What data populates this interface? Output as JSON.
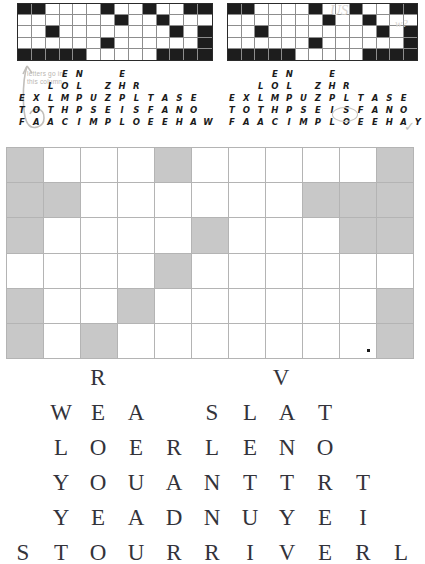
{
  "document": {
    "type": "puzzle-worksheet-scan",
    "background_color": "#ffffff"
  },
  "top_section": {
    "left_grid": {
      "name": "crossword-grid-left",
      "columns": 14,
      "rows": 5,
      "filled_color": "#1d1d1d",
      "empty_color": "#ffffff",
      "cells": [
        [
          1,
          1,
          0,
          0,
          0,
          0,
          1,
          0,
          0,
          1,
          0,
          0,
          1,
          1
        ],
        [
          0,
          0,
          0,
          0,
          0,
          0,
          0,
          1,
          0,
          0,
          1,
          0,
          0,
          0
        ],
        [
          0,
          0,
          1,
          0,
          0,
          0,
          0,
          0,
          0,
          0,
          0,
          1,
          0,
          1
        ],
        [
          0,
          0,
          0,
          0,
          0,
          0,
          1,
          0,
          0,
          0,
          0,
          0,
          0,
          1
        ],
        [
          1,
          1,
          1,
          1,
          1,
          0,
          0,
          0,
          0,
          0,
          1,
          1,
          1,
          1
        ]
      ]
    },
    "right_grid": {
      "name": "crossword-grid-right",
      "columns": 14,
      "rows": 5,
      "filled_color": "#1d1d1d",
      "empty_color": "#ffffff",
      "cells": [
        [
          1,
          1,
          0,
          0,
          0,
          0,
          1,
          0,
          0,
          1,
          0,
          0,
          1,
          1
        ],
        [
          0,
          0,
          0,
          0,
          0,
          0,
          0,
          1,
          0,
          0,
          1,
          0,
          0,
          0
        ],
        [
          0,
          0,
          1,
          0,
          0,
          0,
          0,
          0,
          0,
          0,
          0,
          1,
          0,
          1
        ],
        [
          0,
          0,
          0,
          0,
          0,
          0,
          1,
          0,
          0,
          0,
          0,
          0,
          0,
          1
        ],
        [
          1,
          1,
          1,
          1,
          1,
          0,
          0,
          0,
          0,
          0,
          1,
          1,
          1,
          1
        ]
      ]
    }
  },
  "letter_rows_left": {
    "name": "letter-rows-left",
    "rows": [
      {
        "id": "row-1",
        "letters": [
          "",
          "",
          "",
          "E",
          "N",
          "",
          "",
          "E",
          "",
          "",
          "",
          "",
          ""
        ]
      },
      {
        "id": "row-2",
        "letters": [
          "",
          "",
          "L",
          "O",
          "L",
          "",
          "Z",
          "H",
          "R",
          "",
          "",
          "",
          ""
        ]
      },
      {
        "id": "row-3",
        "letters": [
          "E",
          "X",
          "L",
          "M",
          "P",
          "U",
          "Z",
          "P",
          "L",
          "T",
          "A",
          "S",
          "E"
        ]
      },
      {
        "id": "row-4",
        "letters": [
          "T",
          "O",
          "T",
          "H",
          "P",
          "S",
          "E",
          "I",
          "S",
          "F",
          "A",
          "N",
          "O"
        ]
      },
      {
        "id": "row-5",
        "letters": [
          "F",
          "A",
          "A",
          "C",
          "I",
          "M",
          "P",
          "L",
          "O",
          "E",
          "E",
          "H",
          "A",
          "W"
        ]
      }
    ]
  },
  "letter_rows_right": {
    "name": "letter-rows-right",
    "rows": [
      {
        "id": "row-1",
        "letters": [
          "",
          "",
          "",
          "E",
          "N",
          "",
          "",
          "E",
          "",
          "",
          "",
          "",
          ""
        ]
      },
      {
        "id": "row-2",
        "letters": [
          "",
          "",
          "L",
          "O",
          "L",
          "",
          "Z",
          "H",
          "R",
          "",
          "",
          "",
          ""
        ]
      },
      {
        "id": "row-3",
        "letters": [
          "E",
          "X",
          "L",
          "M",
          "P",
          "U",
          "Z",
          "P",
          "L",
          "T",
          "A",
          "S",
          "E"
        ]
      },
      {
        "id": "row-4",
        "letters": [
          "T",
          "O",
          "T",
          "H",
          "P",
          "S",
          "E",
          "I",
          "S",
          "F",
          "A",
          "N",
          "O"
        ]
      },
      {
        "id": "row-5",
        "letters": [
          "F",
          "A",
          "A",
          "C",
          "I",
          "M",
          "P",
          "L",
          "O",
          "E",
          "E",
          "H",
          "A",
          "Y"
        ]
      }
    ]
  },
  "annotations": {
    "note_line_1": "letters go in",
    "note_line_2": "this column",
    "note_color": "#b9b6b2",
    "check_mark": "✓",
    "scribble_left": "US",
    "scribble_right": "w?"
  },
  "shaded_grid": {
    "name": "shaded-grid",
    "columns": 11,
    "rows": 6,
    "shaded_color": "#c8c8c8",
    "empty_color": "#ffffff",
    "border_color": "#b4b4b4",
    "cells": [
      [
        1,
        0,
        0,
        0,
        1,
        0,
        0,
        0,
        0,
        0,
        1
      ],
      [
        1,
        1,
        0,
        0,
        0,
        0,
        0,
        0,
        1,
        1,
        1
      ],
      [
        1,
        0,
        0,
        0,
        0,
        1,
        0,
        0,
        0,
        1,
        1
      ],
      [
        0,
        0,
        0,
        0,
        1,
        0,
        0,
        0,
        0,
        0,
        0
      ],
      [
        1,
        0,
        0,
        1,
        0,
        0,
        0,
        0,
        0,
        0,
        1
      ],
      [
        1,
        0,
        1,
        0,
        0,
        0,
        0,
        0,
        0,
        0,
        1
      ]
    ],
    "dot_marker": {
      "row": 5,
      "col": 9
    }
  },
  "pyramid": {
    "name": "letter-pyramid",
    "text_color": "#33333a",
    "rows": [
      {
        "id": "pyramid-row-1",
        "letters": [
          "R",
          "",
          "",
          "",
          "",
          "V"
        ],
        "positions": [
          98,
          0,
          0,
          0,
          0,
          281
        ]
      },
      {
        "id": "pyramid-row-2",
        "letters": [
          "W",
          "E",
          "A",
          "S",
          "L",
          "A",
          "T"
        ],
        "positions": [
          61,
          98,
          136,
          212,
          250,
          287,
          325
        ]
      },
      {
        "id": "pyramid-row-3",
        "letters": [
          "L",
          "O",
          "E",
          "R",
          "L",
          "E",
          "N",
          "O"
        ],
        "positions": [
          61,
          98,
          136,
          174,
          212,
          250,
          287,
          325
        ]
      },
      {
        "id": "pyramid-row-4",
        "letters": [
          "Y",
          "O",
          "U",
          "A",
          "N",
          "T",
          "T",
          "R",
          "T"
        ],
        "positions": [
          61,
          98,
          136,
          174,
          212,
          250,
          287,
          325,
          363
        ]
      },
      {
        "id": "pyramid-row-5",
        "letters": [
          "Y",
          "E",
          "A",
          "D",
          "N",
          "U",
          "Y",
          "E",
          "I"
        ],
        "positions": [
          61,
          98,
          136,
          174,
          212,
          250,
          287,
          325,
          363
        ]
      },
      {
        "id": "pyramid-row-6",
        "letters": [
          "S",
          "T",
          "O",
          "U",
          "R",
          "R",
          "I",
          "V",
          "E",
          "R",
          "L"
        ],
        "positions": [
          23,
          61,
          98,
          136,
          174,
          212,
          250,
          287,
          325,
          363,
          401
        ]
      }
    ]
  }
}
